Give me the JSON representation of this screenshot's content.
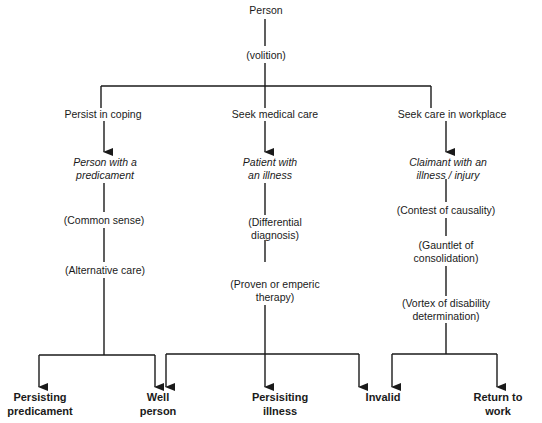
{
  "diagram": {
    "root": "Person",
    "root_connector": "(volition)",
    "branches": [
      {
        "action": "Persist in coping",
        "state": [
          "Person with a",
          "predicament"
        ],
        "steps": [
          [
            "(Common sense)"
          ],
          [
            "(Alternative care)"
          ]
        ],
        "outcomes": [
          [
            "Persisting",
            "predicament"
          ],
          [
            "Well",
            "person"
          ]
        ]
      },
      {
        "action": "Seek medical care",
        "state": [
          "Patient with",
          "an illness"
        ],
        "steps": [
          [
            "(Differential",
            "diagnosis)"
          ],
          [
            "(Proven or emperic",
            "therapy)"
          ]
        ],
        "outcomes": [
          [
            "Well",
            "person"
          ],
          [
            "Persisiting",
            "illness"
          ],
          [
            "Invalid"
          ]
        ]
      },
      {
        "action": "Seek care in workplace",
        "state": [
          "Claimant with an",
          "illness / injury"
        ],
        "steps": [
          [
            "(Contest of causality)"
          ],
          [
            "(Gauntlet of",
            "consolidation)"
          ],
          [
            "(Vortex of disability",
            "determination)"
          ]
        ],
        "outcomes": [
          [
            "Invalid"
          ],
          [
            "Return to",
            "work"
          ]
        ]
      }
    ]
  },
  "colors": {
    "line": "#1a1a1a",
    "text": "#1a1a1a",
    "background": "#ffffff"
  }
}
